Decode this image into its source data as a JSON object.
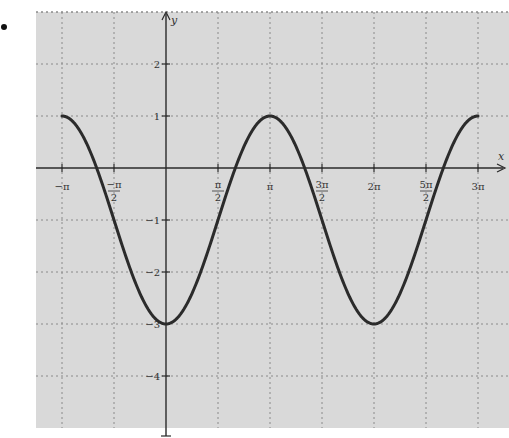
{
  "bullet": "•",
  "chart_data": {
    "type": "line",
    "title": "",
    "xlabel": "x",
    "ylabel": "y",
    "function": "y = -2cos(x) - 1",
    "xlim_pi": [
      -1.5,
      3.5
    ],
    "ylim": [
      -5,
      3
    ],
    "grid": true,
    "grid_style": "dashed",
    "x_ticks": [
      {
        "value_pi": -1,
        "label_num": "−π",
        "label_den": ""
      },
      {
        "value_pi": -0.5,
        "label_num": "−π",
        "label_den": "2"
      },
      {
        "value_pi": 0.5,
        "label_num": "π",
        "label_den": "2"
      },
      {
        "value_pi": 1,
        "label_num": "π",
        "label_den": ""
      },
      {
        "value_pi": 1.5,
        "label_num": "3π",
        "label_den": "2"
      },
      {
        "value_pi": 2,
        "label_num": "2π",
        "label_den": ""
      },
      {
        "value_pi": 2.5,
        "label_num": "5π",
        "label_den": "2"
      },
      {
        "value_pi": 3,
        "label_num": "3π",
        "label_den": ""
      }
    ],
    "y_ticks": [
      {
        "value": 2,
        "label": "2"
      },
      {
        "value": 1,
        "label": "1"
      },
      {
        "value": -1,
        "label": "−1"
      },
      {
        "value": -2,
        "label": "−2"
      },
      {
        "value": -3,
        "label": "−3"
      },
      {
        "value": -4,
        "label": "−4"
      }
    ],
    "series": [
      {
        "name": "y = -2cos(x) - 1",
        "x_domain_pi": [
          -1,
          3
        ],
        "key_points": [
          {
            "x": "−π",
            "y": 1
          },
          {
            "x": "−2π/3",
            "y": 0
          },
          {
            "x": "−π/2",
            "y": -1
          },
          {
            "x": "0",
            "y": -3
          },
          {
            "x": "π/2",
            "y": -1
          },
          {
            "x": "2π/3",
            "y": 0
          },
          {
            "x": "π",
            "y": 1
          },
          {
            "x": "4π/3",
            "y": 0
          },
          {
            "x": "3π/2",
            "y": -1
          },
          {
            "x": "2π",
            "y": -3
          },
          {
            "x": "5π/2",
            "y": -1
          },
          {
            "x": "8π/3",
            "y": 0
          },
          {
            "x": "3π",
            "y": 1
          }
        ]
      }
    ],
    "colors": {
      "background": "#d9d9d9",
      "grid": "#8a8a8a",
      "axis": "#2a2a2a",
      "curve": "#2b2b2b"
    }
  },
  "layout": {
    "plot_left": 36,
    "plot_right": 509,
    "plot_top": 12,
    "plot_bottom": 428,
    "origin_x": 166,
    "origin_y": 168,
    "px_per_half_pi": 52,
    "px_per_unit_y": 52
  }
}
